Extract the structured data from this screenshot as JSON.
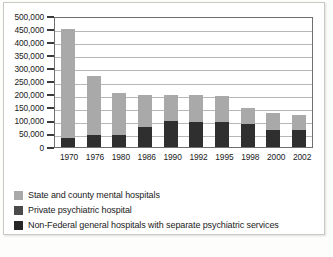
{
  "chart_data": {
    "type": "bar",
    "stacked": true,
    "title": "",
    "subtitle": "",
    "xlabel": "",
    "ylabel": "",
    "grid": true,
    "legend_position": "bottom-left",
    "ylim": [
      0,
      500000
    ],
    "ytick_step": 50000,
    "categories": [
      "1970",
      "1976",
      "1980",
      "1986",
      "1990",
      "1992",
      "1995",
      "1998",
      "2000",
      "2002"
    ],
    "ytick_labels": [
      "500,000",
      "450,000",
      "400,000",
      "350,000",
      "300,000",
      "250,000",
      "200,000",
      "150,000",
      "100,000",
      "50,000",
      "0"
    ],
    "series": [
      {
        "name": "Non-Federal general hospitals with separate psychiatric services",
        "color": "#2f2f2f",
        "values": [
          35000,
          45000,
          45000,
          78000,
          100000,
          96000,
          95000,
          87000,
          65000,
          65000
        ]
      },
      {
        "name": "Private psychiatric hospital",
        "color": "#3c3c3c",
        "values": [
          0,
          0,
          0,
          0,
          0,
          0,
          0,
          0,
          0,
          0
        ]
      },
      {
        "name": "State and county mental hospitals",
        "color": "#a9a9a9",
        "values": [
          415000,
          225000,
          160000,
          122000,
          100000,
          104000,
          100000,
          63000,
          63000,
          58000
        ]
      }
    ],
    "totals": [
      450000,
      270000,
      205000,
      200000,
      200000,
      200000,
      195000,
      150000,
      128000,
      123000
    ]
  },
  "legend": {
    "items": [
      {
        "label": "State and county mental hospitals",
        "color": "#a9a9a9"
      },
      {
        "label": "Private psychiatric hospital",
        "color": "#4a4a4a"
      },
      {
        "label": "Non-Federal general hospitals with separate psychiatric services",
        "color": "#262626"
      }
    ]
  }
}
